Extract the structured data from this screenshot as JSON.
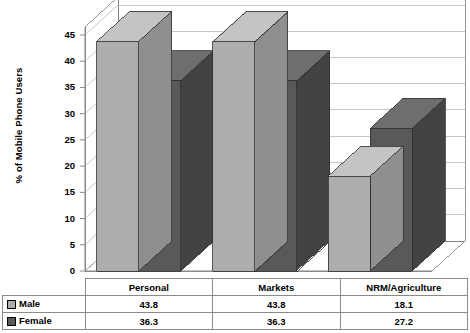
{
  "chart_data": {
    "type": "bar",
    "title": "",
    "subtitle": "",
    "xlabel": "",
    "ylabel": "% of Mobile Phone Users",
    "categories": [
      "Personal",
      "Markets",
      "NRM/Agriculture"
    ],
    "series": [
      {
        "name": "Male",
        "values": [
          43.8,
          43.8,
          18.1
        ],
        "color": "#adadad"
      },
      {
        "name": "Female",
        "values": [
          36.3,
          36.3,
          27.2
        ],
        "color": "#595959"
      }
    ],
    "ylim": [
      0,
      45
    ],
    "ytick_values": [
      0,
      5,
      10,
      15,
      20,
      25,
      30,
      35,
      40,
      45
    ],
    "ytick_labels": [
      "0",
      "5",
      "10",
      "15",
      "20",
      "25",
      "30",
      "35",
      "40",
      "45"
    ],
    "grid": true,
    "grid_axis": "y",
    "legend_position": "data-table-left",
    "three_d": true,
    "data_table_shown": true,
    "annotations": []
  },
  "axis": {
    "y_title": "% of Mobile Phone Users"
  },
  "table": {
    "column_headers": [
      "Personal",
      "Markets",
      "NRM/Agriculture"
    ],
    "rows": [
      {
        "label": "Male",
        "cells": [
          "43.8",
          "43.8",
          "18.1"
        ]
      },
      {
        "label": "Female",
        "cells": [
          "36.3",
          "36.3",
          "27.2"
        ]
      }
    ]
  },
  "colors": {
    "male": "#adadad",
    "female": "#595959",
    "male_top": "#c4c4c4",
    "male_side": "#8f8f8f",
    "female_top": "#6e6e6e",
    "female_side": "#434343",
    "grid": "#b9b9b9",
    "axis": "#7a7a7a",
    "wall": "#c9c9c9",
    "text": "#000000"
  }
}
